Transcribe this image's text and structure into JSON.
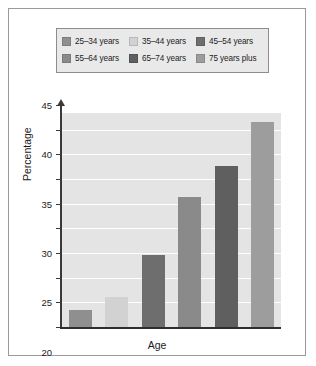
{
  "chart_data": {
    "type": "bar",
    "title": "",
    "xlabel": "Age",
    "ylabel": "Percentage",
    "categories": [
      "25–34 years",
      "35–44 years",
      "45–54 years",
      "55–64 years",
      "65–74 years",
      "75 years plus"
    ],
    "values": [
      3.5,
      6.0,
      14.5,
      26.4,
      32.6,
      41.6
    ],
    "ylim": [
      0,
      45
    ],
    "yticks": [
      0,
      5,
      10,
      15,
      20,
      25,
      30,
      35,
      40,
      45
    ],
    "ytick_labels": [
      "0",
      "5",
      "10",
      "15",
      "20",
      "25",
      "30",
      "35",
      "40",
      "45"
    ],
    "grid": true,
    "legend_position": "top",
    "bar_colors": [
      "#8f8f8f",
      "#d2d2d2",
      "#6e6e6e",
      "#8a8a8a",
      "#5f5f5f",
      "#9d9d9d"
    ],
    "plot_background": "#e4e4e4",
    "gridline_color": "#ffffff"
  },
  "legend": {
    "rows": [
      [
        {
          "label": "25–34 years",
          "color": "#8f8f8f"
        },
        {
          "label": "35–44 years",
          "color": "#d2d2d2"
        },
        {
          "label": "45–54 years",
          "color": "#6e6e6e"
        }
      ],
      [
        {
          "label": "55–64 years",
          "color": "#8a8a8a"
        },
        {
          "label": "65–74 years",
          "color": "#5f5f5f"
        },
        {
          "label": "75 years plus",
          "color": "#9d9d9d"
        }
      ]
    ]
  }
}
